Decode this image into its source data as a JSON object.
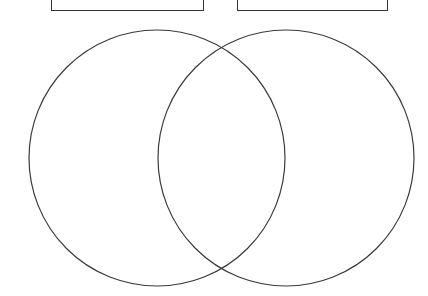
{
  "page": {
    "background_color": "#ffffff",
    "width": 428,
    "height": 296
  },
  "label_boxes": {
    "left": {
      "name": "left-label-box",
      "text": "",
      "placeholder": "",
      "border_color": "#333333",
      "fill_color": "#ffffff",
      "x": 51,
      "y": -26,
      "width": 153,
      "height": 37
    },
    "right": {
      "name": "right-label-box",
      "text": "",
      "placeholder": "",
      "border_color": "#333333",
      "fill_color": "#ffffff",
      "x": 237,
      "y": -26,
      "width": 151,
      "height": 37
    }
  },
  "venn": {
    "stroke_color": "#3a3a3a",
    "stroke_width": 1.2,
    "fill_color": "none",
    "circles": [
      {
        "name": "left-circle",
        "label": "",
        "cx": 157,
        "cy": 158,
        "r": 128
      },
      {
        "name": "right-circle",
        "label": "",
        "cx": 286,
        "cy": 158,
        "r": 128
      }
    ],
    "intersection_points": [
      {
        "x": 217,
        "y": 45
      },
      {
        "x": 217,
        "y": 272
      }
    ],
    "regions": {
      "left_only": "",
      "overlap": "",
      "right_only": ""
    }
  }
}
